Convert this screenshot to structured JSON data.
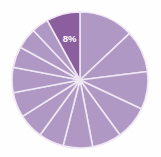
{
  "chart_data": {
    "type": "pie",
    "title": "",
    "subtitle": "",
    "xlabel": "",
    "ylabel": "",
    "grid": false,
    "legend": "none",
    "start_angle_deg": 0,
    "direction": "clockwise",
    "center": {
      "cx": 80,
      "cy": 80
    },
    "radius": 68,
    "colors": {
      "default_slice": "#b098c4",
      "highlight_slice": "#8b5e9e",
      "slice_border": "#efe7f3",
      "label_text": "#ffffff",
      "background": "#fefefe"
    },
    "categories": [
      "Slice 1",
      "Slice 2",
      "Slice 3",
      "Slice 4",
      "Slice 5",
      "Slice 6",
      "Slice 7",
      "Slice 8",
      "Slice 9",
      "Slice 10",
      "Slice 11",
      "Slice 12",
      "Slice 13",
      "Slice 14"
    ],
    "values": [
      13,
      10,
      9,
      8,
      7,
      7,
      6,
      6,
      6,
      6,
      5,
      5,
      4,
      8
    ],
    "slices": [
      {
        "label": "",
        "value": 13,
        "highlight": false,
        "show_label": false
      },
      {
        "label": "",
        "value": 10,
        "highlight": false,
        "show_label": false
      },
      {
        "label": "",
        "value": 9,
        "highlight": false,
        "show_label": false
      },
      {
        "label": "",
        "value": 8,
        "highlight": false,
        "show_label": false
      },
      {
        "label": "",
        "value": 7,
        "highlight": false,
        "show_label": false
      },
      {
        "label": "",
        "value": 7,
        "highlight": false,
        "show_label": false
      },
      {
        "label": "",
        "value": 6,
        "highlight": false,
        "show_label": false
      },
      {
        "label": "",
        "value": 6,
        "highlight": false,
        "show_label": false
      },
      {
        "label": "",
        "value": 6,
        "highlight": false,
        "show_label": false
      },
      {
        "label": "",
        "value": 6,
        "highlight": false,
        "show_label": false
      },
      {
        "label": "",
        "value": 5,
        "highlight": false,
        "show_label": false
      },
      {
        "label": "",
        "value": 5,
        "highlight": false,
        "show_label": false
      },
      {
        "label": "",
        "value": 4,
        "highlight": false,
        "show_label": false
      },
      {
        "label": "8%",
        "value": 8,
        "highlight": true,
        "show_label": true
      }
    ],
    "data_labels": [
      "8%"
    ]
  }
}
